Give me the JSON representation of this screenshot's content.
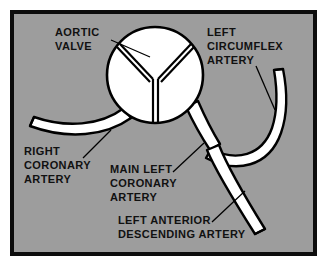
{
  "figure": {
    "kind": "medical-anatomical-diagram"
  },
  "colors": {
    "page_background": "#ffffff",
    "frame_border": "#0d0d0d",
    "panel_background": "#9d9d9d",
    "vessel_fill": "#ffffff",
    "vessel_outline": "#000000",
    "valve_fill": "#ffffff",
    "valve_outline": "#000000",
    "text": "#111111",
    "leader_line": "#000000"
  },
  "frame": {
    "outer_x": 10,
    "outer_y": 10,
    "outer_width": 307,
    "outer_height": 246,
    "border_width": 4
  },
  "labels": {
    "aortic_valve": {
      "name": "aortic-valve-label",
      "lines": [
        "AORTIC",
        "VALVE"
      ],
      "line1": "AORTIC",
      "line2": "VALVE",
      "x": 55,
      "y": 36,
      "align": "start"
    },
    "left_circumflex_artery": {
      "name": "left-circumflex-artery-label",
      "lines": [
        "LEFT",
        "CIRCUMFLEX",
        "ARTERY"
      ],
      "line1": "LEFT",
      "line2": "CIRCUMFLEX",
      "line3": "ARTERY",
      "x": 207,
      "y": 36,
      "align": "start"
    },
    "right_coronary_artery": {
      "name": "right-coronary-artery-label",
      "lines": [
        "RIGHT",
        "CORONARY",
        "ARTERY"
      ],
      "line1": "RIGHT",
      "line2": "CORONARY",
      "line3": "ARTERY",
      "x": 24,
      "y": 155,
      "align": "start"
    },
    "main_left_coronary_artery": {
      "name": "main-left-coronary-artery-label",
      "lines": [
        "MAIN LEFT",
        "CORONARY",
        "ARTERY"
      ],
      "line1": "MAIN LEFT",
      "line2": "CORONARY",
      "line3": "ARTERY",
      "x": 110,
      "y": 173,
      "align": "start"
    },
    "left_anterior_descending_artery": {
      "name": "left-anterior-descending-artery-label",
      "lines": [
        "LEFT ANTERIOR",
        "DESCENDING ARTERY"
      ],
      "line1": "LEFT ANTERIOR",
      "line2": "DESCENDING ARTERY",
      "x": 118,
      "y": 224,
      "align": "start"
    }
  },
  "structures": {
    "aortic_valve": {
      "name": "aortic-valve",
      "shape": "circle",
      "center_x": 155,
      "center_y": 75,
      "radius": 48,
      "cusps": 3,
      "description": "Three-cusp semilunar valve drawn as inverted Y within circle"
    },
    "right_coronary_artery": {
      "name": "right-coronary-artery",
      "origin": "aortic valve left ostium",
      "course": "curves left and downward, open rounded tip at left",
      "tip_x": 30,
      "tip_y": 117
    },
    "main_left_coronary_artery": {
      "name": "main-left-coronary-artery",
      "origin": "aortic valve right ostium",
      "course": "short trunk descending right, bifurcates into circumflex and LAD",
      "bifurcation_x": 209,
      "bifurcation_y": 148
    },
    "left_circumflex_artery": {
      "name": "left-circumflex-artery",
      "origin": "main left coronary bifurcation",
      "course": "sweeps right and curves upward, open rounded tip at upper right",
      "tip_x": 276,
      "tip_y": 70
    },
    "left_anterior_descending_artery": {
      "name": "left-anterior-descending-artery",
      "origin": "main left coronary bifurcation",
      "course": "descends inferiorly and to the right, open rounded tip at lower right",
      "tip_x": 262,
      "tip_y": 240
    }
  },
  "leader_lines": [
    {
      "name": "leader-aortic-valve",
      "from_x": 111,
      "from_y": 40,
      "to_x": 150,
      "to_y": 57
    },
    {
      "name": "leader-left-circumflex-artery",
      "from_x": 256,
      "from_y": 66,
      "to_x": 275,
      "to_y": 108
    },
    {
      "name": "leader-right-coronary-artery",
      "from_x": 83,
      "from_y": 158,
      "to_x": 110,
      "to_y": 131
    },
    {
      "name": "leader-main-left-coronary-artery",
      "from_x": 173,
      "from_y": 172,
      "to_x": 203,
      "to_y": 143
    },
    {
      "name": "leader-left-anterior-descending-artery",
      "from_x": 212,
      "from_y": 222,
      "to_x": 244,
      "to_y": 191
    }
  ]
}
